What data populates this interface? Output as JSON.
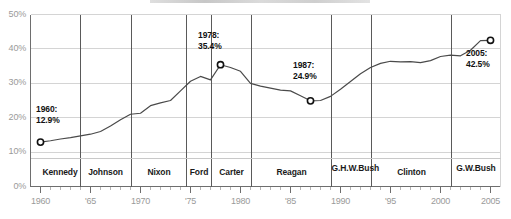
{
  "chart_data": {
    "type": "line",
    "title": "",
    "xlabel": "",
    "ylabel": "",
    "xlim": [
      1959,
      2006
    ],
    "ylim": [
      0,
      50
    ],
    "grid": true,
    "legend": "none",
    "y_ticks": [
      "0%",
      "10%",
      "20%",
      "30%",
      "40%",
      "50%"
    ],
    "y_tick_values": [
      0,
      10,
      20,
      30,
      40,
      50
    ],
    "x_ticks": [
      "1960",
      "'65",
      "1970",
      "'75",
      "1980",
      "'85",
      "1990",
      "'95",
      "2000",
      "2005"
    ],
    "x_tick_values": [
      1960,
      1965,
      1970,
      1975,
      1980,
      1985,
      1990,
      1995,
      2000,
      2005
    ],
    "series": [
      {
        "name": "percent",
        "x": [
          1960,
          1961,
          1962,
          1963,
          1964,
          1965,
          1966,
          1967,
          1968,
          1969,
          1970,
          1971,
          1972,
          1973,
          1974,
          1975,
          1976,
          1977,
          1978,
          1979,
          1980,
          1981,
          1982,
          1983,
          1984,
          1985,
          1986,
          1987,
          1988,
          1989,
          1990,
          1991,
          1992,
          1993,
          1994,
          1995,
          1996,
          1997,
          1998,
          1999,
          2000,
          2001,
          2002,
          2003,
          2004,
          2005
        ],
        "values": [
          12.9,
          13.3,
          13.8,
          14.2,
          14.7,
          15.2,
          16.0,
          17.6,
          19.4,
          21.0,
          21.3,
          23.5,
          24.3,
          25.0,
          27.8,
          30.6,
          32.0,
          31.0,
          35.4,
          34.6,
          33.5,
          30.0,
          29.2,
          28.6,
          28.0,
          27.8,
          26.4,
          24.9,
          25.0,
          26.2,
          28.3,
          30.5,
          32.8,
          34.6,
          35.8,
          36.4,
          36.2,
          36.3,
          36.0,
          36.6,
          37.8,
          38.2,
          38.0,
          39.6,
          42.4,
          42.5
        ]
      }
    ],
    "annotations": [
      {
        "id": "a1960",
        "year": 1960,
        "value": 12.9,
        "year_label": "1960:",
        "value_label": "12.9%"
      },
      {
        "id": "a1978",
        "year": 1978,
        "value": 35.4,
        "year_label": "1978:",
        "value_label": "35.4%"
      },
      {
        "id": "a1987",
        "year": 1987,
        "value": 24.9,
        "year_label": "1987:",
        "value_label": "24.9%"
      },
      {
        "id": "a2005",
        "year": 2005,
        "value": 42.5,
        "year_label": "2005:",
        "value_label": "42.5%"
      }
    ],
    "eras": [
      {
        "name": "Kennedy",
        "start": 1960,
        "end": 1963.9
      },
      {
        "name": "Johnson",
        "start": 1963.9,
        "end": 1969.1
      },
      {
        "name": "Nixon",
        "start": 1969.1,
        "end": 1974.6
      },
      {
        "name": "Ford",
        "start": 1974.6,
        "end": 1977.1
      },
      {
        "name": "Carter",
        "start": 1977.1,
        "end": 1981.1
      },
      {
        "name": "Reagan",
        "start": 1981.1,
        "end": 1989.1
      },
      {
        "name": "G.H.W.\nBush",
        "start": 1989.1,
        "end": 1993.1
      },
      {
        "name": "Clinton",
        "start": 1993.1,
        "end": 2001.1
      },
      {
        "name": "G.W.\nBush",
        "start": 2001.1,
        "end": 2006
      }
    ],
    "colors": {
      "line": "#4a4a4a",
      "grid": "#d4d4d4",
      "axis": "#6e6e6e",
      "marker_stroke": "#111111",
      "marker_fill": "#ffffff",
      "tick_text": "#9a9a9a",
      "era_text": "#1a1a1a",
      "anno_text": "#111111"
    }
  }
}
